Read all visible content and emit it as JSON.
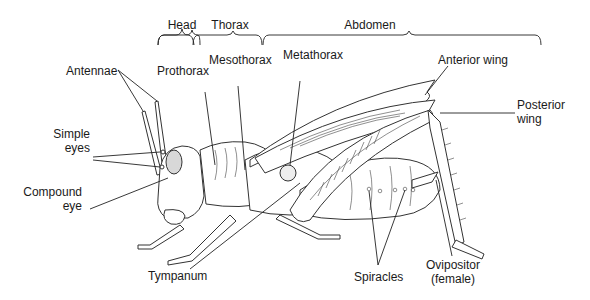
{
  "diagram": {
    "colors": {
      "line": "#222222",
      "background": "#ffffff",
      "eye_fill": "#d8d8d8"
    },
    "regions": [
      {
        "label": "Head"
      },
      {
        "label": "Thorax"
      },
      {
        "label": "Abdomen"
      }
    ],
    "labels": {
      "antennae": "Antennae",
      "simple_eyes_1": "Simple",
      "simple_eyes_2": "eyes",
      "compound_eye_1": "Compound",
      "compound_eye_2": "eye",
      "prothorax": "Prothorax",
      "mesothorax": "Mesothorax",
      "metathorax": "Metathorax",
      "anterior_wing": "Anterior wing",
      "posterior_wing_1": "Posterior",
      "posterior_wing_2": "wing",
      "tympanum": "Tympanum",
      "spiracles": "Spiracles",
      "ovipositor_1": "Ovipositor",
      "ovipositor_2": "(female)"
    }
  }
}
